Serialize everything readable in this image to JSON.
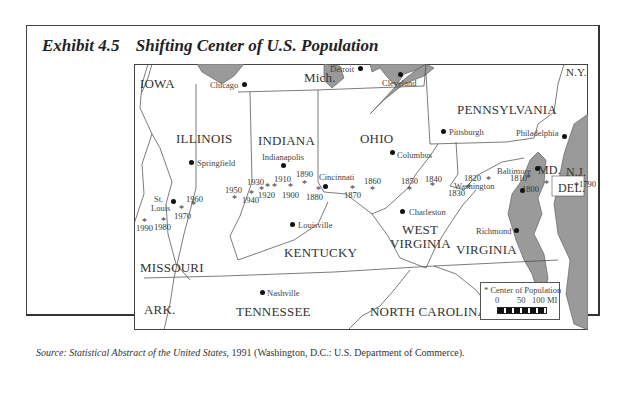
{
  "exhibit": {
    "number": "Exhibit 4.5",
    "title": "Shifting Center of U.S. Population"
  },
  "map": {
    "states": [
      {
        "name": "IOWA"
      },
      {
        "name": "Mich."
      },
      {
        "name": "N.Y."
      },
      {
        "name": "ILLINOIS"
      },
      {
        "name": "INDIANA"
      },
      {
        "name": "OHIO"
      },
      {
        "name": "PENNSYLVANIA"
      },
      {
        "name": "MD."
      },
      {
        "name": "N.J."
      },
      {
        "name": "DEL."
      },
      {
        "name": "WEST"
      },
      {
        "name": "VIRGINIA"
      },
      {
        "name": "KENTUCKY"
      },
      {
        "name": "MISSOURI"
      },
      {
        "name": "VIRGINIA"
      },
      {
        "name": "ARK."
      },
      {
        "name": "TENNESSEE"
      },
      {
        "name": "NORTH CAROLINA"
      }
    ],
    "cities": [
      {
        "name": "Chicago"
      },
      {
        "name": "Detroit"
      },
      {
        "name": "Cleveland"
      },
      {
        "name": "Pittsburgh"
      },
      {
        "name": "Philadelphia"
      },
      {
        "name": "Springfield"
      },
      {
        "name": "Indianapolis"
      },
      {
        "name": "Columbus"
      },
      {
        "name": "Baltimore"
      },
      {
        "name": "Washington"
      },
      {
        "name": "Cincinnati"
      },
      {
        "name": "St."
      },
      {
        "name": "Louis"
      },
      {
        "name": "Charleston"
      },
      {
        "name": "Louisville"
      },
      {
        "name": "Richmond"
      },
      {
        "name": "Nashville"
      }
    ],
    "population_centers": [
      {
        "year": "1790"
      },
      {
        "year": "1800"
      },
      {
        "year": "1810"
      },
      {
        "year": "1820"
      },
      {
        "year": "1830"
      },
      {
        "year": "1840"
      },
      {
        "year": "1850"
      },
      {
        "year": "1860"
      },
      {
        "year": "1870"
      },
      {
        "year": "1880"
      },
      {
        "year": "1890"
      },
      {
        "year": "1900"
      },
      {
        "year": "1910"
      },
      {
        "year": "1920"
      },
      {
        "year": "1930"
      },
      {
        "year": "1940"
      },
      {
        "year": "1950"
      },
      {
        "year": "1960"
      },
      {
        "year": "1970"
      },
      {
        "year": "1980"
      },
      {
        "year": "1990"
      }
    ],
    "marker_symbol": "*",
    "legend": {
      "label": "* Center of Population",
      "scale_ticks": [
        "0",
        "50",
        "100 MI"
      ]
    },
    "colors": {
      "water": "#9a9a9a",
      "land": "#ffffff",
      "border": "#444444"
    }
  },
  "source": {
    "prefix": "Source: ",
    "title": "Statistical Abstract of the United States",
    "rest": ", 1991 (Washington, D.C.: U.S. Department of Commerce)."
  }
}
